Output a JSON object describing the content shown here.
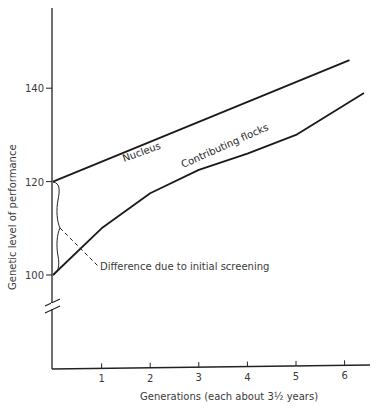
{
  "chart_data": {
    "type": "line",
    "title": "",
    "xlabel": "Generations (each about 3½ years)",
    "ylabel": "Genetic level of performance",
    "x_ticks": [
      "1",
      "2",
      "3",
      "4",
      "5",
      "6"
    ],
    "y_ticks": [
      "100",
      "120",
      "140"
    ],
    "xlim": [
      0,
      6.5
    ],
    "ylim": [
      100,
      156
    ],
    "axis_break": true,
    "grid": false,
    "series": [
      {
        "name": "Nucleus",
        "x": [
          0,
          6.1
        ],
        "y": [
          120,
          146
        ]
      },
      {
        "name": "Contributing flocks",
        "x": [
          0,
          1,
          2,
          3,
          4,
          5,
          6.4
        ],
        "y": [
          100,
          110,
          117.5,
          122.5,
          126,
          130,
          139
        ]
      }
    ],
    "annotations": [
      {
        "text": "Difference due to initial screening",
        "x": 0,
        "y_range": [
          100,
          120
        ]
      }
    ]
  }
}
